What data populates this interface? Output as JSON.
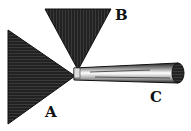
{
  "diagram": {
    "labels": {
      "a": "A",
      "b": "B",
      "c": "C"
    },
    "colors": {
      "ink": "#1a1a1a",
      "paper": "#ffffff"
    }
  }
}
